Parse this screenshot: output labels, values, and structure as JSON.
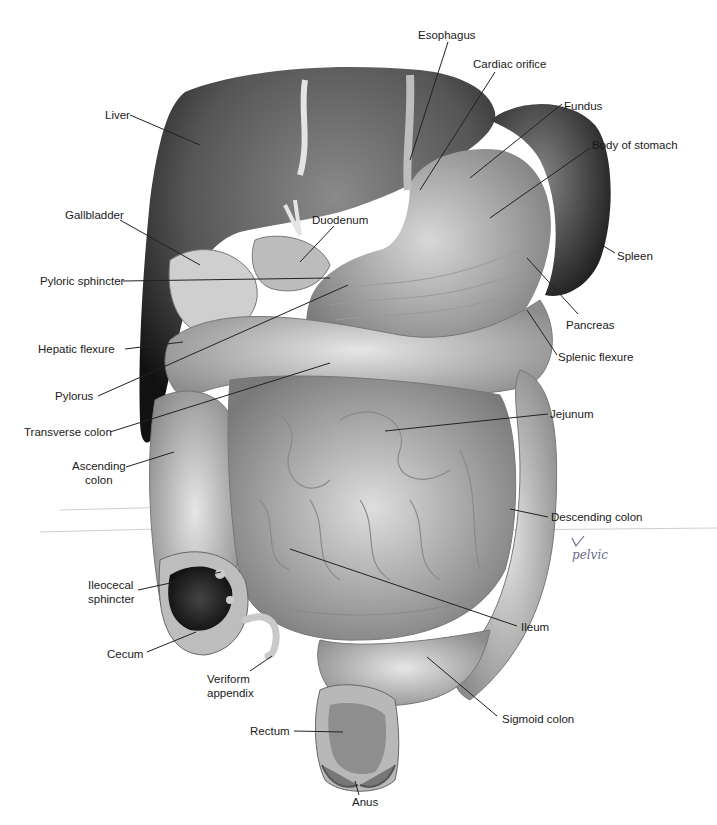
{
  "figure": {
    "labels": [
      {
        "id": "esophagus",
        "text": "Esophagus",
        "x": 418,
        "y": 28
      },
      {
        "id": "cardiac-orifice",
        "text": "Cardiac orifice",
        "x": 473,
        "y": 57
      },
      {
        "id": "fundus",
        "text": "Fundus",
        "x": 564,
        "y": 99
      },
      {
        "id": "body-of-stomach",
        "text": "Body of stomach",
        "x": 592,
        "y": 138
      },
      {
        "id": "liver",
        "text": "Liver",
        "x": 105,
        "y": 110
      },
      {
        "id": "gallbladder",
        "text": "Gallbladder",
        "x": 65,
        "y": 208
      },
      {
        "id": "duodenum",
        "text": "Duodenum",
        "x": 312,
        "y": 213
      },
      {
        "id": "pyloric-sphincter",
        "text": "Pyloric sphincter",
        "x": 40,
        "y": 275
      },
      {
        "id": "spleen",
        "text": "Spleen",
        "x": 617,
        "y": 249
      },
      {
        "id": "pancreas",
        "text": "Pancreas",
        "x": 566,
        "y": 318
      },
      {
        "id": "hepatic-flexure",
        "text": "Hepatic flexure",
        "x": 38,
        "y": 343
      },
      {
        "id": "splenic-flexure",
        "text": "Splenic flexure",
        "x": 558,
        "y": 350
      },
      {
        "id": "pylorus",
        "text": "Pylorus",
        "x": 55,
        "y": 391
      },
      {
        "id": "transverse-colon",
        "text": "Transverse colon",
        "x": 24,
        "y": 426
      },
      {
        "id": "jejunum",
        "text": "Jejunum",
        "x": 550,
        "y": 408
      },
      {
        "id": "ascending-colon",
        "text": "Ascending\ncolon",
        "x": 72,
        "y": 460
      },
      {
        "id": "descending-colon",
        "text": "Descending colon",
        "x": 551,
        "y": 511
      },
      {
        "id": "ileocecal-sphincter",
        "text": "Ileocecal\nsphincter",
        "x": 88,
        "y": 580
      },
      {
        "id": "ileum",
        "text": "Ileum",
        "x": 521,
        "y": 622
      },
      {
        "id": "cecum",
        "text": "Cecum",
        "x": 107,
        "y": 648
      },
      {
        "id": "veriform-appendix",
        "text": "Veriform\nappendix",
        "x": 207,
        "y": 673
      },
      {
        "id": "sigmoid-colon",
        "text": "Sigmoid colon",
        "x": 502,
        "y": 713
      },
      {
        "id": "rectum",
        "text": "Rectum",
        "x": 250,
        "y": 724
      },
      {
        "id": "anus",
        "text": "Anus",
        "x": 352,
        "y": 795
      }
    ],
    "annotation": {
      "mark": "✓",
      "text": "pelvic"
    }
  }
}
